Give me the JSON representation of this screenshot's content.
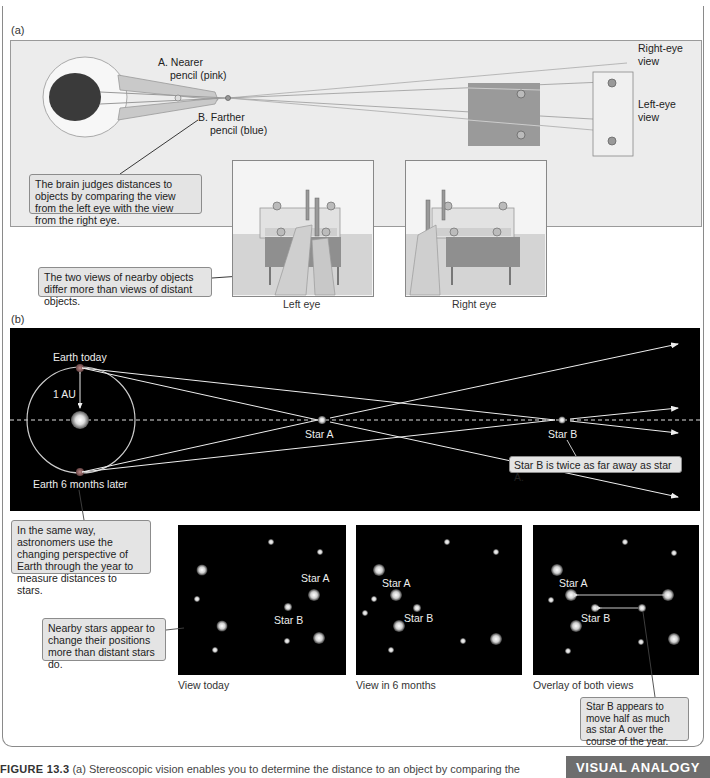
{
  "panel_a": {
    "label": "(a)",
    "nearer_pencil": "A. Nearer pencil (pink)",
    "nearer_pencil_line1": "A. Nearer",
    "nearer_pencil_line2": "pencil (pink)",
    "farther_pencil_line1": "B. Farther",
    "farther_pencil_line2": "pencil (blue)",
    "right_eye_view_line1": "Right-eye",
    "right_eye_view_line2": "view",
    "left_eye_view_line1": "Left-eye",
    "left_eye_view_line2": "view",
    "callout_brain": "The brain judges distances to objects by comparing the view from the left eye with the view from the right eye.",
    "callout_two_views": "The two views of nearby objects differ more than views of distant objects.",
    "left_eye_caption": "Left eye",
    "right_eye_caption": "Right eye"
  },
  "panel_b": {
    "label": "(b)",
    "earth_today": "Earth today",
    "one_au": "1 AU",
    "earth_6_months": "Earth 6 months later",
    "star_a": "Star A",
    "star_b": "Star B",
    "callout_twice": "Star B is twice as far away as star A.",
    "callout_same_way": "In the same way, astronomers use the changing perspective of Earth through the year to measure distances to stars.",
    "callout_nearby": "Nearby stars appear to change their positions more than distant stars do.",
    "callout_half": "Star B appears to move half as much as star A over the course of the year.",
    "view_today": "View today",
    "view_6_months": "View in 6 months",
    "overlay": "Overlay of both views"
  },
  "footer": {
    "figure_number": "FIGURE 13.3",
    "caption_text": "(a) Stereoscopic vision enables you to determine the distance to an object by comparing the",
    "badge": "VISUAL ANALOGY"
  },
  "colors": {
    "panel_bg": "#ececec",
    "callout_bg": "#e4e4e4",
    "space_bg": "#000000",
    "badge_bg": "#6e6e6e"
  }
}
